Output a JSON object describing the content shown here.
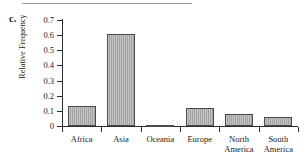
{
  "figure": {
    "panel_letter": "c.",
    "top_rule_color": "#9a9a9a",
    "axis_color": "#2b2b2b",
    "bar_fill_color": "#a9a9a9",
    "bar_edge_color": "#4a4a4a",
    "background_color": "#ffffff"
  },
  "chart_data": {
    "type": "bar",
    "title": "",
    "xlabel": "",
    "ylabel": "Relative Frequency",
    "categories": [
      "Africa",
      "Asia",
      "Oceania",
      "Europe",
      "North America",
      "South America"
    ],
    "category_lines": [
      [
        "Africa"
      ],
      [
        "Asia"
      ],
      [
        "Oceania"
      ],
      [
        "Europe"
      ],
      [
        "North",
        "America"
      ],
      [
        "South",
        "America"
      ]
    ],
    "values": [
      0.13,
      0.605,
      0.005,
      0.12,
      0.08,
      0.06
    ],
    "ylim": [
      0,
      0.7
    ],
    "yticks": [
      0,
      0.1,
      0.2,
      0.3,
      0.4,
      0.5,
      0.6,
      0.7
    ],
    "ytick_labels": [
      "0",
      "0.1",
      "0.2",
      "0.3",
      "0.4",
      "0.5",
      "0.6",
      "0.7"
    ],
    "grid": false,
    "legend": false,
    "legend_position": "none"
  }
}
